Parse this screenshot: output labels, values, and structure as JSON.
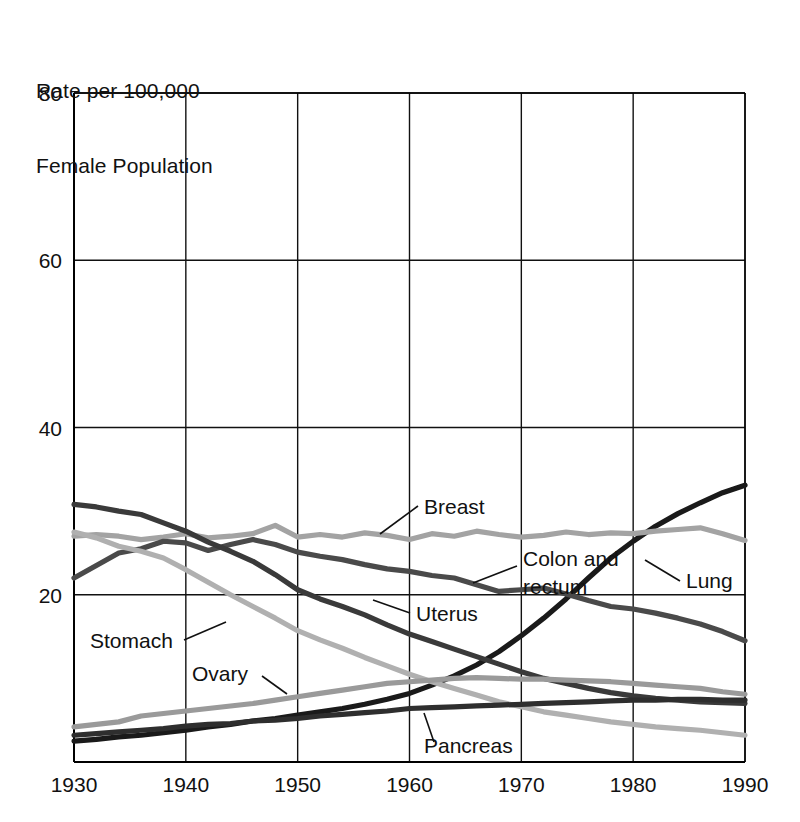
{
  "chart_data": {
    "type": "line",
    "title": "",
    "ylabel_lines": [
      "Rate per 100,000",
      "Female Population"
    ],
    "xlabel": "",
    "xlim": [
      1930,
      1990
    ],
    "ylim": [
      0,
      80
    ],
    "yticks": [
      20,
      40,
      60,
      80
    ],
    "xticks": [
      1930,
      1940,
      1950,
      1960,
      1970,
      1980,
      1990
    ],
    "grid": true,
    "legend_position": "inline-annotations",
    "x": [
      1930,
      1932,
      1934,
      1936,
      1938,
      1940,
      1942,
      1944,
      1946,
      1948,
      1950,
      1952,
      1954,
      1956,
      1958,
      1960,
      1962,
      1964,
      1966,
      1968,
      1970,
      1972,
      1974,
      1976,
      1978,
      1980,
      1982,
      1984,
      1986,
      1988,
      1990
    ],
    "series": [
      {
        "name": "Lung",
        "color": "#1a1a1a",
        "values": [
          2.5,
          2.7,
          3.0,
          3.2,
          3.5,
          3.8,
          4.2,
          4.5,
          4.9,
          5.2,
          5.6,
          6.0,
          6.4,
          6.9,
          7.5,
          8.2,
          9.2,
          10.3,
          11.6,
          13.2,
          15.1,
          17.2,
          19.5,
          22.0,
          24.4,
          26.4,
          28.2,
          29.7,
          31.0,
          32.2,
          33.1
        ]
      },
      {
        "name": "Breast",
        "color": "#a3a3a3",
        "values": [
          27.0,
          27.2,
          27.0,
          26.6,
          26.9,
          27.3,
          26.8,
          27.0,
          27.3,
          28.3,
          26.9,
          27.2,
          26.9,
          27.4,
          27.1,
          26.6,
          27.3,
          27.0,
          27.6,
          27.2,
          26.9,
          27.1,
          27.5,
          27.2,
          27.4,
          27.3,
          27.6,
          27.8,
          28.0,
          27.3,
          26.5
        ]
      },
      {
        "name": "Colon and rectum",
        "color": "#4a4a4a",
        "values": [
          22.0,
          23.5,
          25.0,
          25.5,
          26.4,
          26.2,
          25.3,
          26.0,
          26.6,
          26.0,
          25.1,
          24.6,
          24.2,
          23.6,
          23.1,
          22.8,
          22.3,
          22.0,
          21.2,
          20.4,
          20.6,
          20.8,
          20.1,
          19.3,
          18.6,
          18.3,
          17.8,
          17.2,
          16.5,
          15.6,
          14.5
        ]
      },
      {
        "name": "Uterus",
        "color": "#3a3a3a",
        "values": [
          30.8,
          30.5,
          30.0,
          29.6,
          28.6,
          27.6,
          26.3,
          25.2,
          24.0,
          22.4,
          20.6,
          19.5,
          18.6,
          17.6,
          16.4,
          15.3,
          14.4,
          13.5,
          12.6,
          11.7,
          10.8,
          10.0,
          9.4,
          8.8,
          8.3,
          7.9,
          7.6,
          7.4,
          7.2,
          7.1,
          7.0
        ]
      },
      {
        "name": "Stomach",
        "color": "#b0b0b0",
        "values": [
          27.5,
          26.8,
          25.8,
          25.2,
          24.4,
          23.0,
          21.5,
          20.0,
          18.6,
          17.2,
          15.7,
          14.6,
          13.6,
          12.5,
          11.5,
          10.5,
          9.6,
          8.8,
          8.0,
          7.2,
          6.6,
          6.0,
          5.6,
          5.2,
          4.8,
          4.5,
          4.2,
          4.0,
          3.8,
          3.5,
          3.2
        ]
      },
      {
        "name": "Ovary",
        "color": "#9a9a9a",
        "values": [
          4.2,
          4.5,
          4.8,
          5.5,
          5.8,
          6.1,
          6.4,
          6.7,
          7.0,
          7.4,
          7.8,
          8.2,
          8.6,
          9.0,
          9.4,
          9.6,
          9.8,
          10.0,
          10.1,
          10.0,
          9.9,
          9.9,
          9.8,
          9.7,
          9.6,
          9.4,
          9.2,
          9.0,
          8.8,
          8.4,
          8.1
        ]
      },
      {
        "name": "Pancreas",
        "color": "#2e2e2e",
        "values": [
          3.2,
          3.4,
          3.6,
          3.8,
          4.0,
          4.3,
          4.5,
          4.6,
          4.9,
          5.0,
          5.2,
          5.5,
          5.7,
          5.9,
          6.1,
          6.4,
          6.5,
          6.6,
          6.7,
          6.8,
          6.9,
          7.0,
          7.1,
          7.2,
          7.3,
          7.4,
          7.4,
          7.5,
          7.5,
          7.4,
          7.4
        ]
      }
    ],
    "annotations": [
      {
        "name": "Breast",
        "text": "Breast",
        "text_x": 424,
        "text_y": 514,
        "anchor": "start",
        "leader": [
          418,
          506,
          380,
          534
        ]
      },
      {
        "name": "Colon and rectum",
        "text": "Colon and rectum",
        "text_x": 523,
        "text_y": 566,
        "anchor": "start",
        "leader": [
          517,
          566,
          473,
          583
        ]
      },
      {
        "name": "Lung",
        "text": "Lung",
        "text_x": 686,
        "text_y": 588,
        "anchor": "start",
        "leader": [
          680,
          581,
          645,
          560
        ]
      },
      {
        "name": "Uterus",
        "text": "Uterus",
        "text_x": 416,
        "text_y": 621,
        "anchor": "start",
        "leader": [
          410,
          613,
          373,
          600
        ]
      },
      {
        "name": "Stomach",
        "text": "Stomach",
        "text_x": 90,
        "text_y": 648,
        "anchor": "start",
        "leader": [
          184,
          640,
          226,
          622
        ]
      },
      {
        "name": "Ovary",
        "text": "Ovary",
        "text_x": 192,
        "text_y": 681,
        "anchor": "start",
        "leader": [
          262,
          676,
          287,
          694
        ]
      },
      {
        "name": "Pancreas",
        "text": "Pancreas",
        "text_x": 424,
        "text_y": 753,
        "anchor": "start",
        "leader": [
          434,
          742,
          424,
          713
        ]
      }
    ]
  },
  "axis": {
    "ylabel_line1": "Rate per 100,000",
    "ylabel_line2": "Female Population",
    "ytick_labels": [
      "80",
      "60",
      "40",
      "20"
    ],
    "xtick_labels": [
      "1930",
      "1940",
      "1950",
      "1960",
      "1970",
      "1980",
      "1990"
    ]
  },
  "annotation_labels": {
    "breast": "Breast",
    "colon_line1": "Colon and",
    "colon_line2": "rectum",
    "lung": "Lung",
    "uterus": "Uterus",
    "stomach": "Stomach",
    "ovary": "Ovary",
    "pancreas": "Pancreas"
  },
  "colors": {
    "axis": "#000000",
    "grid": "#111111",
    "background": "#ffffff"
  }
}
